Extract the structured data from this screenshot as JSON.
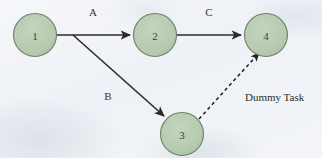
{
  "diagram": {
    "type": "activity-on-arrow-network-diagram",
    "canvas": {
      "width": 322,
      "height": 158
    },
    "colors": {
      "background": "#f1f3f7",
      "node_fill": "#b7cbb0",
      "node_stroke": "#6f7f6c",
      "edge_solid": "#2b2b2b",
      "edge_dashed": "#1f1f1f",
      "label_text": "#333333"
    },
    "nodes": [
      {
        "id": "node-1",
        "label": "1",
        "cx": 35,
        "cy": 35,
        "r": 21.5
      },
      {
        "id": "node-2",
        "label": "2",
        "cx": 155,
        "cy": 35,
        "r": 21.5
      },
      {
        "id": "node-3",
        "label": "3",
        "cx": 182,
        "cy": 134,
        "r": 21.5
      },
      {
        "id": "node-4",
        "label": "4",
        "cx": 266,
        "cy": 35,
        "r": 21.5
      }
    ],
    "edges": [
      {
        "id": "edge-a",
        "from": "node-1",
        "to": "node-2",
        "label": "A",
        "style": "solid",
        "arrow": true,
        "label_x": 93,
        "label_y": 16
      },
      {
        "id": "edge-c",
        "from": "node-2",
        "to": "node-4",
        "label": "C",
        "style": "solid",
        "arrow": true,
        "label_x": 209,
        "label_y": 16
      },
      {
        "id": "edge-b",
        "from": "node-1",
        "to": "node-3",
        "label": "B",
        "style": "solid",
        "arrow": true,
        "label_x": 108,
        "label_y": 100
      },
      {
        "id": "edge-dummy",
        "from": "node-3",
        "to": "node-4",
        "label": "Dummy Task",
        "style": "dashed",
        "arrow": true,
        "label_x": 245,
        "label_y": 101
      }
    ]
  }
}
